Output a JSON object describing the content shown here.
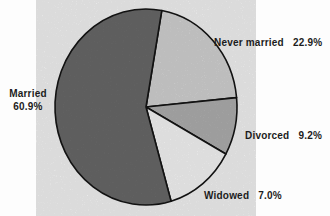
{
  "figure": {
    "background_color": "#fdfdfd",
    "text_color": "#1c1c1c",
    "outline_color": "#151515"
  },
  "chart_data": {
    "type": "pie",
    "title": "",
    "unit": "percent",
    "legend_position": "labels-around-pie",
    "slices": [
      {
        "label": "Never married",
        "value": 22.9,
        "display": "22.9%",
        "color": "#dbdbdb",
        "start_deg": 80,
        "end_deg": 5.5
      },
      {
        "label": "Divorced",
        "value": 9.2,
        "display": "9.2%",
        "color": "#b6b6b6",
        "start_deg": 5.5,
        "end_deg": -28.7
      },
      {
        "label": "Widowed",
        "value": 7.0,
        "display": "7.0%",
        "color": "#ffffff",
        "start_deg": -28.7,
        "end_deg": -74
      },
      {
        "label": "Married",
        "value": 60.9,
        "display": "60.9%",
        "color": "#6d6d6d",
        "start_deg": -74,
        "end_deg": -280
      }
    ],
    "geometry": {
      "cx": 146,
      "cy": 107,
      "rx": 91,
      "ry": 98,
      "stroke": "#151515",
      "stroke_width": 1.6,
      "grain_opacity": 0.13
    }
  }
}
